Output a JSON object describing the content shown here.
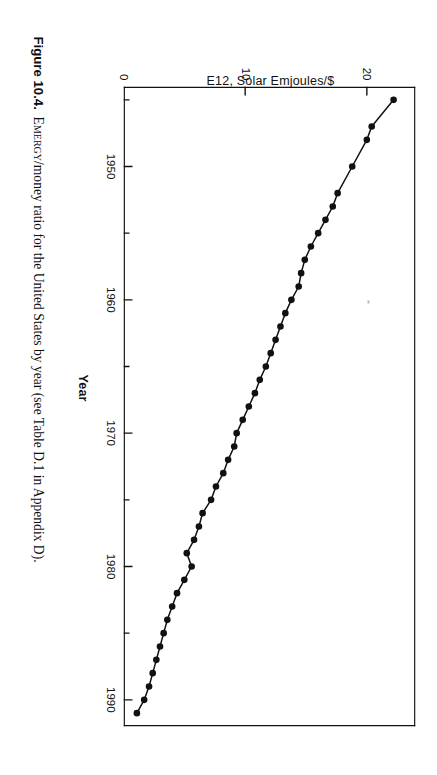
{
  "page": {
    "background": "#ffffff",
    "ink_color": "#111111",
    "orientation_note": "page rotated 90 degrees clockwise"
  },
  "caption": {
    "figure_number": "Figure 10.4.",
    "lead_smallcaps": "Emergy",
    "text": "/money ratio for the United States by year (see Table D.1 in Appendix D)."
  },
  "axes": {
    "x_title": "Year",
    "y_title": "E12, Solar Emjoules/$",
    "x_tick_labels": [
      "1950",
      "1960",
      "1970",
      "1980",
      "1990"
    ],
    "y_tick_labels": [
      "0",
      "10",
      "20"
    ]
  },
  "chart_data": {
    "type": "line",
    "title": "EMERGY/money ratio for the United States by year",
    "xlabel": "Year",
    "ylabel": "E12, Solar Emjoules/$",
    "xlim": [
      1944,
      1992
    ],
    "ylim": [
      0,
      24
    ],
    "xticks_major": [
      1950,
      1960,
      1970,
      1980,
      1990
    ],
    "xticks_minor": [
      1945,
      1955,
      1965,
      1975,
      1985
    ],
    "yticks": [
      0,
      10,
      20
    ],
    "grid": false,
    "legend": false,
    "marker": "filled-circle",
    "series": [
      {
        "name": "EMERGY/money ratio",
        "x": [
          1945,
          1947,
          1948,
          1950,
          1952,
          1953,
          1954,
          1955,
          1956,
          1957,
          1958,
          1959,
          1960,
          1961,
          1962,
          1963,
          1964,
          1965,
          1966,
          1967,
          1968,
          1969,
          1970,
          1971,
          1972,
          1973,
          1974,
          1975,
          1976,
          1977,
          1978,
          1979,
          1980,
          1981,
          1982,
          1983,
          1984,
          1985,
          1986,
          1987,
          1988,
          1989,
          1990,
          1991
        ],
        "y": [
          22.2,
          20.4,
          20.0,
          18.8,
          17.6,
          17.2,
          16.6,
          16.0,
          15.4,
          14.9,
          14.6,
          14.4,
          13.8,
          13.3,
          12.9,
          12.5,
          12.1,
          11.7,
          11.2,
          10.8,
          10.3,
          9.8,
          9.3,
          9.1,
          8.6,
          8.2,
          7.6,
          7.2,
          6.5,
          6.2,
          5.8,
          5.2,
          5.6,
          5.0,
          4.4,
          4.0,
          3.6,
          3.3,
          3.0,
          2.7,
          2.4,
          2.1,
          1.7,
          1.1
        ]
      }
    ]
  }
}
